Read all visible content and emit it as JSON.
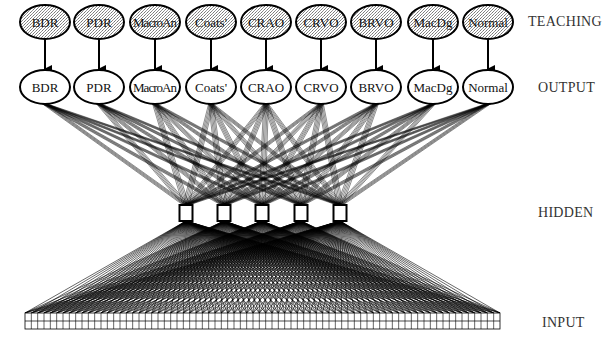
{
  "diagram": {
    "type": "neural-network",
    "layers": {
      "teaching": {
        "label": "TEACHING",
        "nodes": [
          "BDR",
          "PDR",
          "MacroAn",
          "Coats'",
          "CRAO",
          "CRVO",
          "BRVO",
          "MacDg",
          "Normal"
        ],
        "style": "stippled-ellipse"
      },
      "output": {
        "label": "OUTPUT",
        "nodes": [
          "BDR",
          "PDR",
          "MacroAn",
          "Coats'",
          "CRAO",
          "CRVO",
          "BRVO",
          "MacDg",
          "Normal"
        ],
        "style": "white-ellipse"
      },
      "hidden": {
        "label": "HIDDEN",
        "count": 5,
        "style": "square"
      },
      "input": {
        "label": "INPUT",
        "columns": 75,
        "rows": 2,
        "style": "grid"
      }
    },
    "connections": [
      "teaching -> output (one-to-one arrows)",
      "hidden -> output (fully connected)",
      "input -> hidden (fully connected)"
    ],
    "colors": {
      "stroke": "#000000",
      "stipple": "#c8c8c8",
      "background": "#ffffff",
      "label": "#333333"
    }
  }
}
